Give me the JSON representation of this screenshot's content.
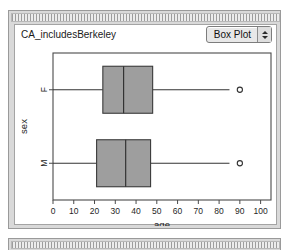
{
  "window": {
    "title_bar_style": "striped-texture"
  },
  "panel": {
    "plot_title": "CA_includesBerkeley",
    "plot_type_selector": {
      "selected": "Box Plot",
      "options": [
        "Box Plot"
      ],
      "up_arrow": "stepper-up",
      "down_arrow": "stepper-down"
    }
  },
  "chart_data": {
    "type": "box",
    "orientation": "horizontal",
    "title": "CA_includesBerkeley",
    "xlabel": "age",
    "ylabel": "sex",
    "xlim": [
      0,
      105
    ],
    "xticks": [
      0,
      10,
      20,
      30,
      40,
      50,
      60,
      70,
      80,
      90,
      100
    ],
    "xtick_labels": [
      "0",
      "10",
      "20",
      "30",
      "40",
      "50",
      "60",
      "70",
      "80",
      "90",
      "100"
    ],
    "categories": [
      "F",
      "M"
    ],
    "grid": false,
    "legend": false,
    "box_fill_color": "#9e9e9e",
    "box_edge_color": "#3a3a3a",
    "boxes": [
      {
        "category": "F",
        "whisker_low": 0,
        "q1": 24,
        "median": 34,
        "q3": 48,
        "whisker_high": 85,
        "outliers": [
          90
        ]
      },
      {
        "category": "M",
        "whisker_low": 0,
        "q1": 21,
        "median": 35,
        "q3": 47,
        "whisker_high": 85,
        "outliers": [
          90
        ]
      }
    ]
  }
}
